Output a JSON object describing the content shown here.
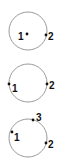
{
  "diagram": {
    "colors": {
      "circle_stroke": "#9a9a9a",
      "point_fill": "#111111",
      "label": "#111111"
    },
    "panels": [
      {
        "circle": {
          "cx": 28,
          "cy": 31,
          "r": 19
        },
        "points": [
          {
            "label": "1",
            "x": 27,
            "y": 34,
            "lx": 18,
            "ly": 40
          },
          {
            "label": "2",
            "x": 46,
            "y": 35,
            "lx": 48,
            "ly": 40
          }
        ]
      },
      {
        "circle": {
          "cx": 28,
          "cy": 83,
          "r": 19
        },
        "points": [
          {
            "label": "1",
            "x": 9,
            "y": 84,
            "lx": 12,
            "ly": 92
          },
          {
            "label": "2",
            "x": 47,
            "y": 84,
            "lx": 49,
            "ly": 89
          }
        ]
      },
      {
        "circle": {
          "cx": 28,
          "cy": 138,
          "r": 19
        },
        "points": [
          {
            "label": "1",
            "x": 12,
            "y": 132,
            "lx": 14,
            "ly": 141
          },
          {
            "label": "3",
            "x": 33,
            "y": 120,
            "lx": 36,
            "ly": 121
          },
          {
            "label": "2",
            "x": 46,
            "y": 143,
            "lx": 48,
            "ly": 148
          }
        ]
      }
    ]
  }
}
